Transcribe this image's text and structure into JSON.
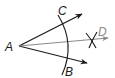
{
  "diagram": {
    "type": "angle-bisector-construction",
    "labels": {
      "vertex": "A",
      "ray1_point": "C",
      "ray2_point": "B",
      "bisector_point": "D"
    },
    "colors": {
      "ink": "#1a1a1a",
      "bisector": "#8a8a8a",
      "background": "#ffffff"
    }
  }
}
